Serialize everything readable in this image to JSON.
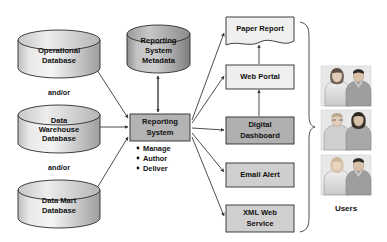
{
  "diagram": {
    "background_color": "#ffffff",
    "sources": [
      {
        "id": "operational-database",
        "label_lines": [
          "Operational",
          "Database"
        ],
        "shape": "cylinder",
        "fill": "#d9d9d9",
        "x": 18,
        "y": 30,
        "w": 82,
        "h": 48
      },
      {
        "id": "data-warehouse-database",
        "label_lines": [
          "Data",
          "Warehouse",
          "Database"
        ],
        "shape": "cylinder",
        "fill": "#d9d9d9",
        "x": 18,
        "y": 105,
        "w": 82,
        "h": 48
      },
      {
        "id": "data-mart-database",
        "label_lines": [
          "Data Mart",
          "Database"
        ],
        "shape": "cylinder",
        "fill": "#d9d9d9",
        "x": 18,
        "y": 180,
        "w": 82,
        "h": 48
      }
    ],
    "connectors_text": [
      {
        "id": "and-or-1",
        "label": "and/or",
        "x": 59,
        "y": 92
      },
      {
        "id": "and-or-2",
        "label": "and/or",
        "x": 59,
        "y": 167
      }
    ],
    "metadata_store": {
      "id": "reporting-system-metadata",
      "label_lines": [
        "Reporting",
        "System",
        "Metadata"
      ],
      "shape": "cylinder",
      "fill": "#b3b3b3",
      "x": 127,
      "y": 25,
      "w": 63,
      "h": 48
    },
    "core": {
      "id": "reporting-system",
      "label_lines": [
        "Reporting",
        "System"
      ],
      "shape": "rectangle",
      "fill": "#b3b3b3",
      "x": 130,
      "y": 114,
      "w": 60,
      "h": 27,
      "bullets": [
        "Manage",
        "Author",
        "Deliver"
      ]
    },
    "outputs": [
      {
        "id": "paper-report",
        "label_lines": [
          "Paper Report"
        ],
        "shape": "document",
        "fill": "#efefef",
        "x": 226,
        "y": 17,
        "w": 68,
        "h": 28
      },
      {
        "id": "web-portal",
        "label_lines": [
          "Web Portal"
        ],
        "shape": "rectangle",
        "fill": "#efefef",
        "x": 226,
        "y": 65,
        "w": 68,
        "h": 24
      },
      {
        "id": "digital-dashboard",
        "label_lines": [
          "Digital",
          "Dashboard"
        ],
        "shape": "rectangle",
        "fill": "#b0b0b0",
        "x": 226,
        "y": 117,
        "w": 68,
        "h": 27
      },
      {
        "id": "email-alert",
        "label_lines": [
          "Email Alert"
        ],
        "shape": "rectangle",
        "fill": "#cfcfcf",
        "x": 226,
        "y": 163,
        "w": 68,
        "h": 24
      },
      {
        "id": "xml-web-service",
        "label_lines": [
          "XML Web",
          "Service"
        ],
        "shape": "rectangle",
        "fill": "#cfcfcf",
        "x": 226,
        "y": 205,
        "w": 68,
        "h": 27
      }
    ],
    "users": {
      "id": "users",
      "label": "Users",
      "photo_count": 3,
      "photos": [
        {
          "id": "users-photo-1",
          "x": 321,
          "y": 66,
          "w": 50,
          "h": 40
        },
        {
          "id": "users-photo-2",
          "x": 321,
          "y": 110,
          "w": 50,
          "h": 40
        },
        {
          "id": "users-photo-3",
          "x": 321,
          "y": 155,
          "w": 50,
          "h": 40
        }
      ],
      "label_x": 346,
      "label_y": 208,
      "brace": {
        "x": 300,
        "y_top": 22,
        "y_bottom": 232,
        "point_y": 127
      }
    }
  }
}
